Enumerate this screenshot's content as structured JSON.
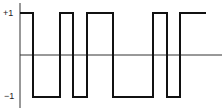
{
  "chart_data": {
    "type": "line",
    "title": "",
    "xlabel": "",
    "ylabel": "",
    "ylim": [
      -1,
      1
    ],
    "y_ticks": [
      "+1",
      "−1"
    ],
    "grid": false,
    "series": [
      {
        "name": "binary square wave",
        "step": true,
        "x": [
          0,
          13,
          13,
          40,
          40,
          53,
          53,
          67,
          67,
          93,
          93,
          133,
          133,
          147,
          147,
          160,
          160,
          186
        ],
        "values": [
          1,
          1,
          -1,
          -1,
          1,
          1,
          -1,
          -1,
          1,
          1,
          -1,
          -1,
          1,
          1,
          -1,
          -1,
          1,
          1
        ]
      }
    ]
  },
  "labels": {
    "plus_one": "+1",
    "minus_one": "−1"
  },
  "colors": {
    "signal": "#111111",
    "axis": "#333333"
  }
}
